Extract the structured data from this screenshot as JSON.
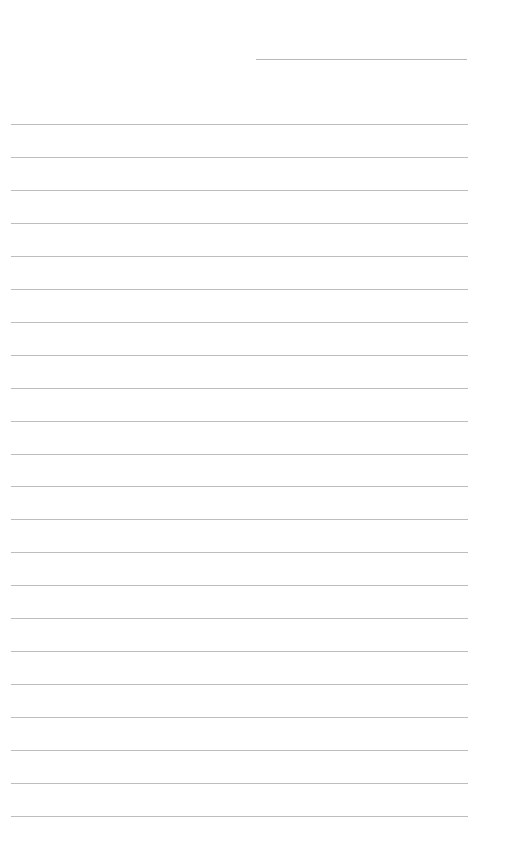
{
  "page": {
    "type": "ruled-notebook-page",
    "background": "#ffffff",
    "line_color": "#bdbdbd",
    "header_line": {
      "x": 256,
      "y": 59,
      "width": 211
    },
    "rules": {
      "count": 22,
      "start_y": 124,
      "spacing": 32.95,
      "x": 11,
      "width": 457
    }
  }
}
